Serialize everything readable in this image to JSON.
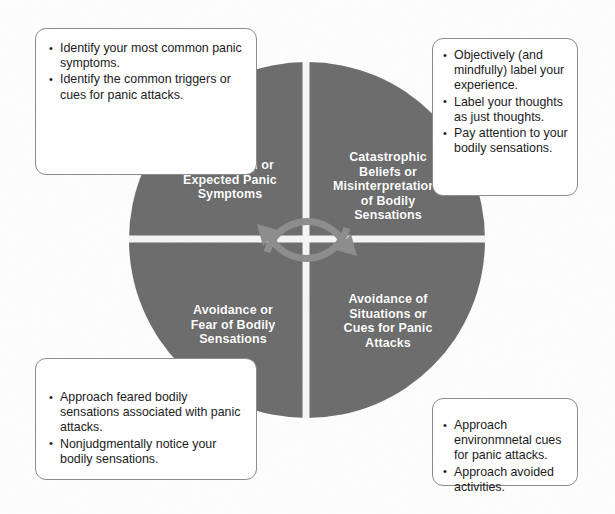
{
  "diagram": {
    "type": "quadrant-cycle-wheel",
    "colors": {
      "wheel_fill": "#6e6e6e",
      "wheel_divider": "#f2f2f2",
      "arrow": "#8d8d8d",
      "box_border": "#8c8c8c",
      "label_text": "#ffffff",
      "body_text": "#1b1b1b",
      "background": "#fdfdfd"
    },
    "quadrants": [
      {
        "id": "top-left",
        "label": "Unexpected or\nExpected Panic\nSymptoms",
        "line1": "Unexpected or",
        "line2": "Expected Panic",
        "line3": "Symptoms"
      },
      {
        "id": "top-right",
        "label": "Catastrophic\nBeliefs or\nMisinterpretations\nof  Bodily\nSensations",
        "line1": "Catastrophic",
        "line2": "Beliefs or",
        "line3": "Misinterpretations",
        "line4": "of  Bodily",
        "line5": "Sensations"
      },
      {
        "id": "bottom-left",
        "label": "Avoidance or\nFear of Bodily\nSensations",
        "line1": "Avoidance or",
        "line2": "Fear of Bodily",
        "line3": "Sensations"
      },
      {
        "id": "bottom-right",
        "label": "Avoidance of\nSituations or\nCues for Panic\nAttacks",
        "line1": "Avoidance of",
        "line2": "Situations or",
        "line3": "Cues for Panic",
        "line4": "Attacks"
      }
    ],
    "callouts": [
      {
        "id": "top-left-callout",
        "position": "top-left",
        "items": [
          "Identify your most common panic symptoms.",
          "Identify the common triggers or cues for panic attacks."
        ]
      },
      {
        "id": "top-right-callout",
        "position": "top-right",
        "items": [
          "Objectively (and mindfully) label your experience.",
          "Label your thoughts as just thoughts.",
          "Pay attention to your bodily sensations."
        ]
      },
      {
        "id": "bottom-left-callout",
        "position": "bottom-left",
        "items": [
          "Approach feared bodily sensations associated with panic attacks.",
          "Nonjudgmentally notice your bodily sensations."
        ]
      },
      {
        "id": "bottom-right-callout",
        "position": "bottom-right",
        "items": [
          "Approach environmnetal cues for panic attacks.",
          "Approach avoided activities."
        ]
      }
    ],
    "center": {
      "icon": "circular-cycle-arrows",
      "arrow_count": 2
    }
  }
}
